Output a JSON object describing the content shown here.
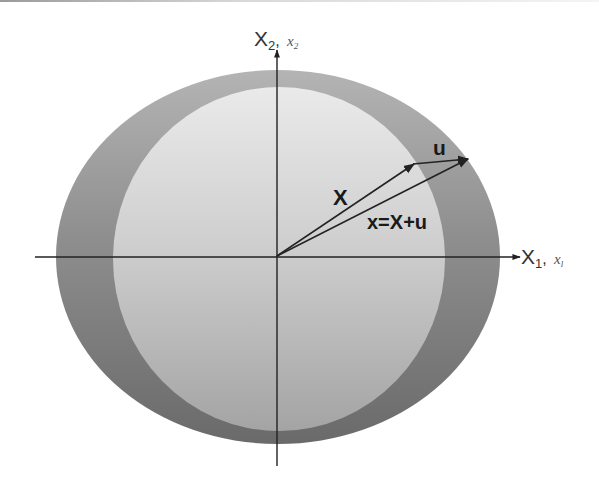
{
  "figure": {
    "type": "deformation-kinematics-diagram",
    "colors": {
      "background": "#ffffff",
      "outer_region_top": "#aaaaaa",
      "outer_region_bottom": "#6e6e6e",
      "inner_region_top": "#e4e4e4",
      "inner_region_bottom": "#a8a8a8",
      "axis": "#222222",
      "vector": "#222222"
    },
    "axes": {
      "horizontal": {
        "label_main": "X",
        "label_main_sub": "1",
        "separator": ",",
        "label_alt": "x",
        "label_alt_sub": "l"
      },
      "vertical": {
        "label_main": "X",
        "label_main_sub": "2",
        "separator": ",",
        "label_alt": "x",
        "label_alt_sub": "2"
      }
    },
    "regions": [
      {
        "name": "current-configuration",
        "shape": "ellipse",
        "description": "outer deformed body"
      },
      {
        "name": "reference-configuration",
        "shape": "circle",
        "description": "inner undeformed body"
      }
    ],
    "vectors": [
      {
        "name": "position-X",
        "label": "X",
        "from": "origin",
        "to": "material point"
      },
      {
        "name": "displacement-u",
        "label": "u",
        "from": "tip of X",
        "to": "tip of x"
      },
      {
        "name": "position-x",
        "label": "x=X+u",
        "from": "origin",
        "to": "spatial point"
      }
    ]
  }
}
